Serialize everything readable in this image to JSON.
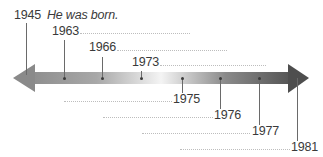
{
  "timeline": {
    "events": [
      {
        "year": "1945",
        "note": "He was born."
      },
      {
        "year": "1963"
      },
      {
        "year": "1966"
      },
      {
        "year": "1973"
      },
      {
        "year": "1975"
      },
      {
        "year": "1976"
      },
      {
        "year": "1977"
      },
      {
        "year": "1981"
      }
    ],
    "colors": {
      "arrow_dark": "#555555",
      "arrow_mid": "#9a9a9a",
      "arrow_light": "#f2f2f2",
      "text": "#3a3a3a",
      "dotted_line": "#bdbdbd"
    }
  }
}
